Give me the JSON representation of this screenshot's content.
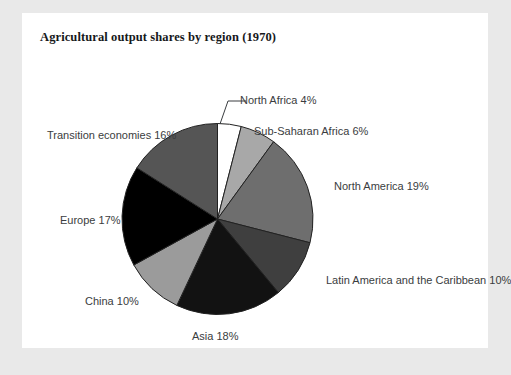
{
  "card": {
    "title": "Agricultural output shares by region (1970)"
  },
  "chart_data": {
    "type": "pie",
    "title": "Agricultural output shares by region (1970)",
    "xlabel": "",
    "ylabel": "",
    "legend_position": "none",
    "grid": false,
    "value_unit": "%",
    "start_angle_deg": 0,
    "direction": "clockwise",
    "categories": [
      "North Africa",
      "Sub-Saharan Africa",
      "North America",
      "Latin America and the Caribbean",
      "Asia",
      "China",
      "Europe",
      "Transition economies"
    ],
    "values": [
      4,
      6,
      19,
      10,
      18,
      10,
      17,
      16
    ],
    "colors": [
      "#ffffff",
      "#a8a8a8",
      "#6e6e6e",
      "#3f3f3f",
      "#121212",
      "#9b9b9b",
      "#000000",
      "#555555"
    ],
    "slice_stroke": "#222222",
    "labels": [
      {
        "name": "North Africa",
        "text": "North Africa 4%",
        "value": 4,
        "color": "#ffffff"
      },
      {
        "name": "Sub-Saharan Africa",
        "text": "Sub-Saharan Africa 6%",
        "value": 6,
        "color": "#a8a8a8"
      },
      {
        "name": "North America",
        "text": "North America 19%",
        "value": 19,
        "color": "#6e6e6e"
      },
      {
        "name": "Latin America and the Caribbean",
        "text": "Latin America and the Caribbean 10%",
        "value": 10,
        "color": "#3f3f3f"
      },
      {
        "name": "Asia",
        "text": "Asia 18%",
        "value": 18,
        "color": "#121212"
      },
      {
        "name": "China",
        "text": "China 10%",
        "value": 10,
        "color": "#9b9b9b"
      },
      {
        "name": "Europe",
        "text": "Europe 17%",
        "value": 17,
        "color": "#000000"
      },
      {
        "name": "Transition economies",
        "text": "Transition economies 16%",
        "value": 16,
        "color": "#555555"
      }
    ]
  },
  "label_positions": [
    {
      "key": "north-africa",
      "x": 218,
      "y": 82,
      "align": "start"
    },
    {
      "key": "sub-saharan-africa",
      "x": 232,
      "y": 113,
      "align": "start"
    },
    {
      "key": "north-america",
      "x": 312,
      "y": 168,
      "align": "start"
    },
    {
      "key": "latin-america",
      "x": 304,
      "y": 262,
      "align": "start"
    },
    {
      "key": "asia",
      "x": 170,
      "y": 318,
      "align": "start"
    },
    {
      "key": "china",
      "x": 63,
      "y": 283,
      "align": "start"
    },
    {
      "key": "europe",
      "x": 38,
      "y": 202,
      "align": "start"
    },
    {
      "key": "transition-economies",
      "x": 25,
      "y": 117,
      "align": "start"
    }
  ]
}
